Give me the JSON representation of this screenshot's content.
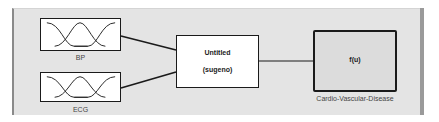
{
  "diagram": {
    "inputs": [
      {
        "label": "BP",
        "icon": "membership-functions-icon"
      },
      {
        "label": "ECG",
        "icon": "membership-functions-icon"
      }
    ],
    "fis": {
      "title": "Untitled",
      "type": "(sugeno)"
    },
    "output": {
      "expr": "f(u)",
      "label": "Cardio-Vascular-Disease"
    },
    "colors": {
      "canvas": "#e4e4e4",
      "line": "#1a1a1a",
      "output_fill": "#dcdcdc"
    }
  }
}
